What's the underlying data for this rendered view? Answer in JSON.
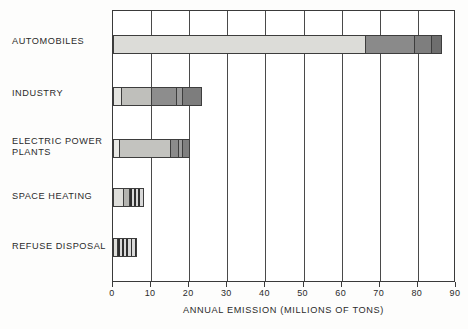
{
  "chart_data": {
    "type": "bar",
    "orientation": "horizontal",
    "title": "",
    "xlabel": "ANNUAL EMISSION (MILLIONS OF TONS)",
    "ylabel": "",
    "xlim": [
      0,
      90
    ],
    "xticks": [
      0,
      10,
      20,
      30,
      40,
      50,
      60,
      70,
      80,
      90
    ],
    "xtick_labels": [
      "0",
      "10",
      "20",
      "30",
      "40",
      "50",
      "60",
      "70",
      "80",
      "90"
    ],
    "grid": true,
    "legend": "none",
    "categories": [
      "AUTOMOBILES",
      "INDUSTRY",
      "ELECTRIC POWER\nPLANTS",
      "SPACE HEATING",
      "REFUSE DISPOSAL"
    ],
    "values": [
      86,
      23,
      20,
      8,
      6
    ],
    "stacked_segments": [
      {
        "category": "AUTOMOBILES",
        "total": 86,
        "segments": [
          {
            "start": 0,
            "end": 66,
            "value": 66,
            "fill": "#dcdcd8",
            "style": "solid"
          },
          {
            "start": 66,
            "end": 79,
            "value": 13,
            "fill": "#8a8a8a",
            "style": "solid"
          },
          {
            "start": 79,
            "end": 83.5,
            "value": 4.5,
            "fill": "#7e7e7e",
            "style": "solid"
          },
          {
            "start": 83.5,
            "end": 86,
            "value": 2.5,
            "fill": "#6e6e6e",
            "style": "solid"
          }
        ]
      },
      {
        "category": "INDUSTRY",
        "total": 23,
        "segments": [
          {
            "start": 0,
            "end": 2,
            "value": 2,
            "fill": "#e4e4e0",
            "style": "solid"
          },
          {
            "start": 2,
            "end": 10,
            "value": 8,
            "fill": "#bfbfbb",
            "style": "solid"
          },
          {
            "start": 10,
            "end": 16.5,
            "value": 6.5,
            "fill": "#8d8d8d",
            "style": "solid"
          },
          {
            "start": 16.5,
            "end": 18,
            "value": 1.5,
            "fill": "#9a9a9a",
            "style": "solid"
          },
          {
            "start": 18,
            "end": 23,
            "value": 5,
            "fill": "#7d7d7d",
            "style": "solid"
          }
        ]
      },
      {
        "category": "ELECTRIC POWER PLANTS",
        "total": 20,
        "segments": [
          {
            "start": 0,
            "end": 1.5,
            "value": 1.5,
            "fill": "#e8e8e4",
            "style": "solid"
          },
          {
            "start": 1.5,
            "end": 15,
            "value": 13.5,
            "fill": "#c3c3bf",
            "style": "solid"
          },
          {
            "start": 15,
            "end": 17,
            "value": 2,
            "fill": "#8b8b8b",
            "style": "solid"
          },
          {
            "start": 17,
            "end": 18,
            "value": 1,
            "fill": "#9d9d9d",
            "style": "solid"
          },
          {
            "start": 18,
            "end": 20,
            "value": 2,
            "fill": "#7f7f7f",
            "style": "solid"
          }
        ]
      },
      {
        "category": "SPACE HEATING",
        "total": 8,
        "segments": [
          {
            "start": 0,
            "end": 2.5,
            "value": 2.5,
            "fill": "#dededa",
            "style": "solid"
          },
          {
            "start": 2.5,
            "end": 4.2,
            "value": 1.7,
            "fill": "#b4b4b0",
            "style": "solid"
          },
          {
            "start": 4.2,
            "end": 8,
            "value": 3.8,
            "fill": "#c9c9c9",
            "style": "hatch"
          }
        ]
      },
      {
        "category": "REFUSE DISPOSAL",
        "total": 6,
        "segments": [
          {
            "start": 0,
            "end": 1,
            "value": 1,
            "fill": "#dededa",
            "style": "solid"
          },
          {
            "start": 1,
            "end": 6,
            "value": 5,
            "fill": "#c9c9c9",
            "style": "hatch"
          }
        ]
      }
    ]
  },
  "axis": {
    "x_title": "ANNUAL EMISSION (MILLIONS OF TONS)"
  },
  "labels": {
    "automobiles": "AUTOMOBILES",
    "industry": "INDUSTRY",
    "electric_power_plants": "ELECTRIC POWER\nPLANTS",
    "space_heating": "SPACE HEATING",
    "refuse_disposal": "REFUSE DISPOSAL"
  },
  "colors": {
    "frame": "#3a3a3a",
    "grid": "#4a4a4a",
    "text": "#2b2b2b",
    "background": "#fdfdfc"
  }
}
